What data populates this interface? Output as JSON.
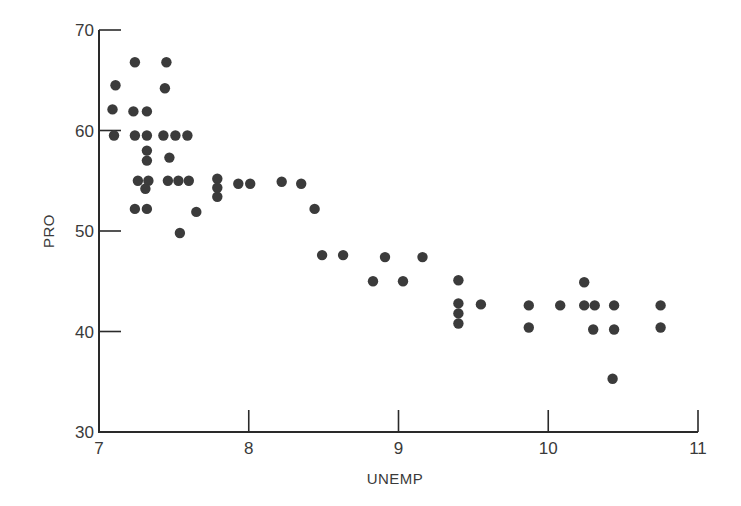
{
  "chart_data": {
    "type": "scatter",
    "title": "",
    "xlabel": "UNEMP",
    "ylabel": "PRO",
    "xlim": [
      7,
      11
    ],
    "ylim": [
      30,
      70
    ],
    "xticks": [
      7,
      8,
      9,
      10,
      11
    ],
    "yticks": [
      30,
      40,
      50,
      60,
      70
    ],
    "xtick_labels": [
      "7",
      "8",
      "9",
      "10",
      "11"
    ],
    "ytick_labels": [
      "30",
      "40",
      "50",
      "60",
      "70"
    ],
    "grid": false,
    "legend": null,
    "marker_color": "#3b3b3b",
    "series": [
      {
        "name": "PRO vs UNEMP",
        "points": [
          {
            "x": 7.09,
            "y": 62.1
          },
          {
            "x": 7.11,
            "y": 64.5
          },
          {
            "x": 7.1,
            "y": 59.5
          },
          {
            "x": 7.24,
            "y": 66.8
          },
          {
            "x": 7.23,
            "y": 61.9
          },
          {
            "x": 7.32,
            "y": 61.9
          },
          {
            "x": 7.24,
            "y": 59.5
          },
          {
            "x": 7.32,
            "y": 59.5
          },
          {
            "x": 7.32,
            "y": 58.0
          },
          {
            "x": 7.32,
            "y": 57.0
          },
          {
            "x": 7.26,
            "y": 55.0
          },
          {
            "x": 7.33,
            "y": 55.0
          },
          {
            "x": 7.31,
            "y": 54.2
          },
          {
            "x": 7.24,
            "y": 52.2
          },
          {
            "x": 7.32,
            "y": 52.2
          },
          {
            "x": 7.45,
            "y": 66.8
          },
          {
            "x": 7.44,
            "y": 64.2
          },
          {
            "x": 7.43,
            "y": 59.5
          },
          {
            "x": 7.51,
            "y": 59.5
          },
          {
            "x": 7.59,
            "y": 59.5
          },
          {
            "x": 7.47,
            "y": 57.3
          },
          {
            "x": 7.46,
            "y": 55.0
          },
          {
            "x": 7.53,
            "y": 55.0
          },
          {
            "x": 7.6,
            "y": 55.0
          },
          {
            "x": 7.65,
            "y": 51.9
          },
          {
            "x": 7.54,
            "y": 49.8
          },
          {
            "x": 7.79,
            "y": 55.2
          },
          {
            "x": 7.79,
            "y": 54.3
          },
          {
            "x": 7.79,
            "y": 53.4
          },
          {
            "x": 7.93,
            "y": 54.7
          },
          {
            "x": 8.01,
            "y": 54.7
          },
          {
            "x": 8.22,
            "y": 54.9
          },
          {
            "x": 8.35,
            "y": 54.7
          },
          {
            "x": 8.44,
            "y": 52.2
          },
          {
            "x": 8.49,
            "y": 47.6
          },
          {
            "x": 8.63,
            "y": 47.6
          },
          {
            "x": 8.83,
            "y": 45.0
          },
          {
            "x": 8.91,
            "y": 47.4
          },
          {
            "x": 9.03,
            "y": 45.0
          },
          {
            "x": 9.16,
            "y": 47.4
          },
          {
            "x": 9.4,
            "y": 45.1
          },
          {
            "x": 9.4,
            "y": 42.8
          },
          {
            "x": 9.4,
            "y": 41.8
          },
          {
            "x": 9.4,
            "y": 40.8
          },
          {
            "x": 9.55,
            "y": 42.7
          },
          {
            "x": 9.87,
            "y": 42.6
          },
          {
            "x": 9.87,
            "y": 40.4
          },
          {
            "x": 10.08,
            "y": 42.6
          },
          {
            "x": 10.24,
            "y": 44.9
          },
          {
            "x": 10.24,
            "y": 42.6
          },
          {
            "x": 10.31,
            "y": 42.6
          },
          {
            "x": 10.3,
            "y": 40.2
          },
          {
            "x": 10.44,
            "y": 42.6
          },
          {
            "x": 10.44,
            "y": 40.2
          },
          {
            "x": 10.43,
            "y": 35.3
          },
          {
            "x": 10.75,
            "y": 42.6
          },
          {
            "x": 10.75,
            "y": 40.4
          }
        ]
      }
    ]
  },
  "layout": {
    "plot_left_px": 99,
    "plot_right_px": 698,
    "plot_top_px": 30,
    "plot_bottom_px": 432,
    "tick_length_px": 22,
    "point_radius_px": 5.2
  }
}
